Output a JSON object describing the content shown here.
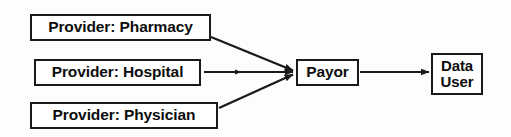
{
  "diagram": {
    "background_color": "#fdfdfd",
    "line_color": "#1a1a1a",
    "box_fill": "#ffffff",
    "nodes": {
      "pharmacy": {
        "label": "Provider: Pharmacy"
      },
      "hospital": {
        "label": "Provider: Hospital"
      },
      "physician": {
        "label": "Provider: Physician"
      },
      "payor": {
        "label": "Payor"
      },
      "data_user": {
        "line1": "Data",
        "line2": "User"
      }
    },
    "edges": [
      {
        "from": "Provider: Pharmacy",
        "to": "Payor",
        "style": "arrow",
        "direction": "diagonal-down-right"
      },
      {
        "from": "Provider: Hospital",
        "to": "Payor",
        "style": "arrow",
        "direction": "horizontal"
      },
      {
        "from": "Provider: Physician",
        "to": "Payor",
        "style": "arrow",
        "direction": "diagonal-up-right"
      },
      {
        "from": "Payor",
        "to": "Data User",
        "style": "arrow",
        "direction": "horizontal"
      }
    ]
  }
}
